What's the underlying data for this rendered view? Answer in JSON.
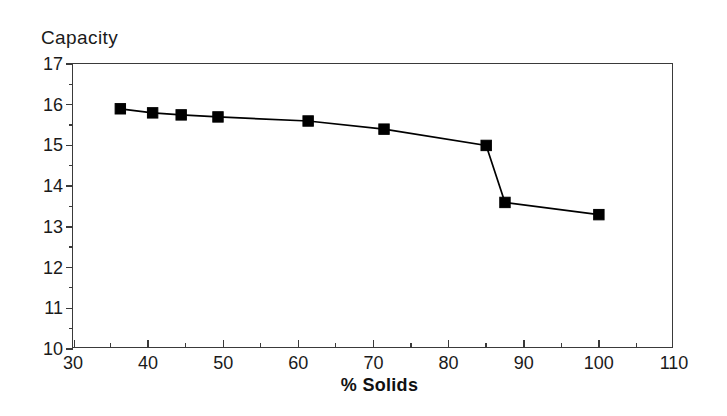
{
  "chart_data": {
    "type": "line",
    "title": "",
    "xlabel": "% Solids",
    "ylabel": "Capacity",
    "xlim": [
      30,
      110
    ],
    "ylim": [
      10,
      17
    ],
    "grid": false,
    "legend": null,
    "x_major_ticks": [
      30,
      40,
      50,
      60,
      70,
      80,
      90,
      100,
      110
    ],
    "x_minor_step": 5,
    "y_major_ticks": [
      10,
      11,
      12,
      13,
      14,
      15,
      16,
      17
    ],
    "y_minor_step": 0.5,
    "marker": "filled-square",
    "marker_color": "#000000",
    "line_color": "#000000",
    "series": [
      {
        "name": "Capacity",
        "x": [
          36.3,
          40.6,
          44.4,
          49.3,
          61.3,
          71.4,
          85.0,
          87.5,
          100.0
        ],
        "values": [
          15.9,
          15.8,
          15.75,
          15.7,
          15.6,
          15.4,
          15.0,
          13.6,
          13.3
        ]
      }
    ]
  },
  "axes": {
    "y_title": "Capacity",
    "x_title": "% Solids",
    "y_tick_labels": [
      "17",
      "16",
      "15",
      "14",
      "13",
      "12",
      "11",
      "10"
    ],
    "x_tick_labels": [
      "30",
      "40",
      "50",
      "60",
      "70",
      "80",
      "90",
      "100",
      "110"
    ]
  },
  "style": {
    "background": "#ffffff",
    "frame_color": "#3a3a3a",
    "text_color": "#1a1a1a"
  }
}
